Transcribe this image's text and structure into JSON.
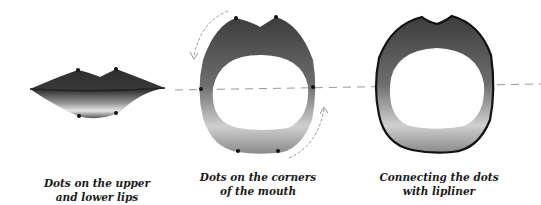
{
  "panels": [
    {
      "id": "closed-lips",
      "caption_line1": "Dots on the upper",
      "caption_line2": "and lower lips"
    },
    {
      "id": "open-mouth-dots",
      "caption_line1": "Dots on the corners",
      "caption_line2": "of the mouth"
    },
    {
      "id": "open-mouth-lined",
      "caption_line1": "Connecting the dots",
      "caption_line2": "with lipliner"
    }
  ],
  "colors": {
    "lip_dark": "#3a3a3a",
    "lip_mid": "#7a7a7a",
    "lip_light": "#d8d8d8",
    "outline": "#111111",
    "guide": "#999999"
  }
}
